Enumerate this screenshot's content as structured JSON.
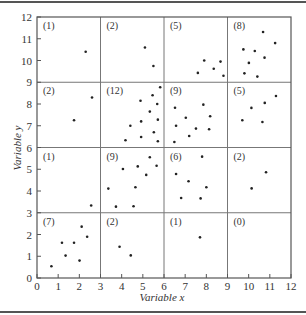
{
  "chart_data": {
    "type": "scatter",
    "title": "",
    "xlabel": "Variable x",
    "ylabel": "Variable y",
    "xlim": [
      0,
      12
    ],
    "ylim": [
      0,
      12
    ],
    "xticks": [
      0,
      1,
      2,
      3,
      4,
      5,
      6,
      7,
      8,
      9,
      10,
      11,
      12
    ],
    "yticks": [
      0,
      1,
      2,
      3,
      4,
      5,
      6,
      7,
      8,
      9,
      10,
      11,
      12
    ],
    "grid_lines_x": [
      3,
      6,
      9
    ],
    "grid_lines_y": [
      3,
      6,
      9
    ],
    "grid": "3x3 quadrat grid dividing plot into 16 cells",
    "cells": [
      {
        "col": 0,
        "row": 3,
        "label": "(1)",
        "count": 1
      },
      {
        "col": 1,
        "row": 3,
        "label": "(2)",
        "count": 2
      },
      {
        "col": 2,
        "row": 3,
        "label": "(5)",
        "count": 5
      },
      {
        "col": 3,
        "row": 3,
        "label": "(8)",
        "count": 8
      },
      {
        "col": 0,
        "row": 2,
        "label": "(2)",
        "count": 2
      },
      {
        "col": 1,
        "row": 2,
        "label": "(12)",
        "count": 12
      },
      {
        "col": 2,
        "row": 2,
        "label": "(9)",
        "count": 9
      },
      {
        "col": 3,
        "row": 2,
        "label": "(5)",
        "count": 5
      },
      {
        "col": 0,
        "row": 1,
        "label": "(1)",
        "count": 1
      },
      {
        "col": 1,
        "row": 1,
        "label": "(9)",
        "count": 9
      },
      {
        "col": 2,
        "row": 1,
        "label": "(6)",
        "count": 6
      },
      {
        "col": 3,
        "row": 1,
        "label": "(2)",
        "count": 2
      },
      {
        "col": 0,
        "row": 0,
        "label": "(7)",
        "count": 7
      },
      {
        "col": 1,
        "row": 0,
        "label": "(2)",
        "count": 2
      },
      {
        "col": 2,
        "row": 0,
        "label": "(1)",
        "count": 1
      },
      {
        "col": 3,
        "row": 0,
        "label": "(0)",
        "count": 0
      }
    ],
    "points": [
      [
        2.3,
        10.4
      ],
      [
        5.1,
        10.6
      ],
      [
        5.5,
        9.75
      ],
      [
        7.9,
        10.0
      ],
      [
        8.67,
        9.95
      ],
      [
        8.35,
        9.62
      ],
      [
        7.6,
        9.43
      ],
      [
        8.81,
        9.3
      ],
      [
        10.68,
        11.31
      ],
      [
        11.25,
        10.8
      ],
      [
        9.75,
        10.51
      ],
      [
        10.29,
        10.44
      ],
      [
        10.75,
        10.13
      ],
      [
        10.01,
        9.89
      ],
      [
        9.8,
        9.41
      ],
      [
        10.41,
        9.26
      ],
      [
        2.6,
        8.3
      ],
      [
        1.75,
        7.25
      ],
      [
        5.82,
        8.77
      ],
      [
        5.46,
        8.4
      ],
      [
        4.89,
        8.15
      ],
      [
        5.68,
        8.0
      ],
      [
        5.33,
        7.65
      ],
      [
        4.41,
        7.0
      ],
      [
        4.92,
        7.2
      ],
      [
        5.71,
        7.28
      ],
      [
        5.52,
        6.7
      ],
      [
        4.18,
        6.33
      ],
      [
        4.92,
        6.48
      ],
      [
        5.71,
        6.29
      ],
      [
        6.52,
        7.83
      ],
      [
        7.86,
        7.97
      ],
      [
        7.03,
        7.37
      ],
      [
        8.18,
        7.44
      ],
      [
        6.57,
        7.0
      ],
      [
        7.51,
        6.87
      ],
      [
        8.13,
        6.84
      ],
      [
        7.19,
        6.53
      ],
      [
        6.49,
        6.25
      ],
      [
        11.29,
        8.37
      ],
      [
        10.76,
        8.05
      ],
      [
        10.13,
        7.82
      ],
      [
        9.7,
        7.25
      ],
      [
        10.65,
        7.17
      ],
      [
        2.56,
        3.33
      ],
      [
        5.33,
        5.55
      ],
      [
        5.65,
        5.16
      ],
      [
        4.06,
        5.01
      ],
      [
        4.76,
        5.13
      ],
      [
        5.16,
        4.74
      ],
      [
        3.37,
        4.11
      ],
      [
        4.65,
        4.17
      ],
      [
        3.73,
        3.28
      ],
      [
        4.56,
        3.3
      ],
      [
        7.8,
        5.58
      ],
      [
        6.57,
        4.78
      ],
      [
        7.16,
        4.45
      ],
      [
        8.0,
        4.17
      ],
      [
        6.81,
        3.68
      ],
      [
        7.73,
        3.66
      ],
      [
        10.82,
        4.86
      ],
      [
        10.14,
        4.12
      ],
      [
        2.11,
        2.36
      ],
      [
        2.37,
        1.9
      ],
      [
        1.18,
        1.62
      ],
      [
        1.75,
        1.62
      ],
      [
        1.35,
        1.03
      ],
      [
        2.01,
        0.8
      ],
      [
        0.68,
        0.54
      ],
      [
        3.9,
        1.44
      ],
      [
        4.43,
        1.04
      ],
      [
        7.7,
        1.87
      ]
    ],
    "legend": null,
    "colors": {
      "axis": "#555555",
      "grid": "#777777",
      "point": "#222222",
      "text": "#333333"
    }
  }
}
